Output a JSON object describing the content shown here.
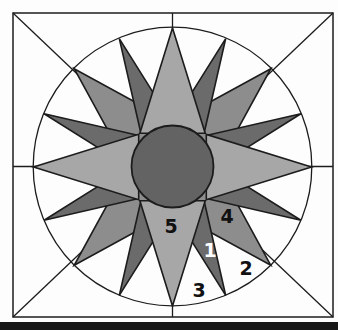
{
  "figure": {
    "block": {
      "shape": "square",
      "guides": [
        "diagonal-lines",
        "center-vertical-line",
        "center-horizontal-line",
        "inscribed-circle"
      ],
      "points_total": 16,
      "groups": [
        {
          "name": "cardinal-points",
          "count": 4,
          "piece_number": "5",
          "shade": "light-gray"
        },
        {
          "name": "diagonal-points",
          "count": 4,
          "piece_number": "4",
          "shade": "medium-gray"
        },
        {
          "name": "sixteenth-points",
          "count": 8,
          "piece_number": "1",
          "shade": "dark-gray"
        },
        {
          "name": "background-wedge-outer",
          "piece_number": "2",
          "shade": "white"
        },
        {
          "name": "background-wedge-cardinal",
          "piece_number": "3",
          "shade": "white"
        }
      ]
    },
    "labels": [
      {
        "text": "5",
        "x": 171,
        "y": 233,
        "color": "#111111"
      },
      {
        "text": "4",
        "x": 227,
        "y": 223,
        "color": "#111111"
      },
      {
        "text": "1",
        "x": 210,
        "y": 257,
        "color": "#ffffff"
      },
      {
        "text": "2",
        "x": 246,
        "y": 275,
        "color": "#111111"
      },
      {
        "text": "3",
        "x": 199,
        "y": 297,
        "color": "#111111"
      }
    ],
    "colors": {
      "background": "#fdfdfd",
      "line": "#1c1c1c",
      "cardinal_points": "#a7a7a7",
      "diagonal_points": "#8d8d8d",
      "sixteenth_points": "#6b6b6b",
      "center_circle": "#636363",
      "bottom_bar": "#181818"
    }
  }
}
